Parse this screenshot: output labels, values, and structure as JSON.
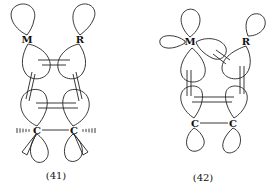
{
  "figure": {
    "diagrams": [
      {
        "id": "41",
        "label": "(41)",
        "atoms": {
          "top_left": "M",
          "top_right": "R",
          "bottom_left": "C",
          "bottom_right": "C"
        }
      },
      {
        "id": "42",
        "label": "(42)",
        "atoms": {
          "top_left": "M",
          "top_right": "R",
          "bottom_left": "C",
          "bottom_right": "C"
        }
      }
    ]
  }
}
